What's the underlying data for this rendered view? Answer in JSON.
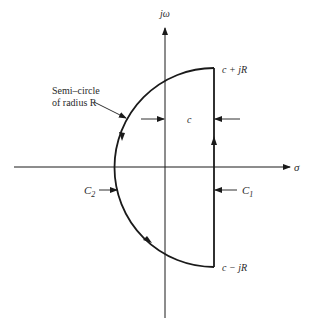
{
  "diagram": {
    "axes": {
      "vertical_label": "jω",
      "horizontal_label": "σ"
    },
    "points": {
      "top": "c + jR",
      "bottom": "c − jR"
    },
    "dimension_label": "c",
    "contours": {
      "c1": "C",
      "c1_sub": "1",
      "c2": "C",
      "c2_sub": "2"
    },
    "annotation": {
      "line1": "Semi–circle",
      "line2": "of radius R"
    },
    "colors": {
      "line": "#1a1a1a",
      "text": "#2a2a2a",
      "background": "#ffffff"
    }
  }
}
